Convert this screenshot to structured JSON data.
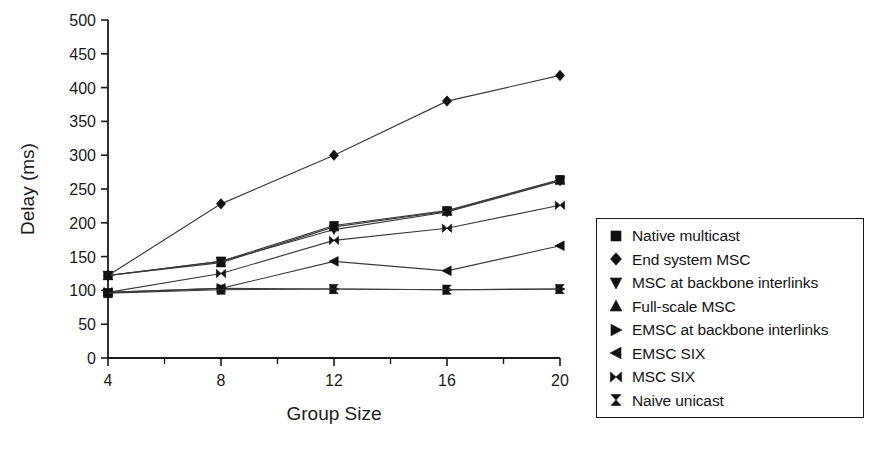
{
  "chart_data": {
    "type": "line",
    "title": "",
    "xlabel": "Group Size",
    "ylabel": "Delay (ms)",
    "x": [
      4,
      8,
      12,
      16,
      20
    ],
    "xticklabels": [
      "4",
      "8",
      "12",
      "16",
      "20"
    ],
    "yticklabels": [
      "0",
      "50",
      "100",
      "150",
      "200",
      "250",
      "300",
      "350",
      "400",
      "450",
      "500"
    ],
    "yticks": [
      0,
      50,
      100,
      150,
      200,
      250,
      300,
      350,
      400,
      450,
      500
    ],
    "xlim": [
      4,
      20
    ],
    "ylim": [
      0,
      500
    ],
    "grid": false,
    "legend_position": "right-outside",
    "minor_ticks_x": true,
    "series": [
      {
        "name": "Native multicast",
        "marker": "square",
        "values": [
          122,
          143,
          196,
          218,
          264
        ]
      },
      {
        "name": "End system MSC",
        "marker": "diamond",
        "values": [
          122,
          228,
          300,
          380,
          418
        ]
      },
      {
        "name": "MSC at backbone interlinks",
        "marker": "triangle-down",
        "values": [
          122,
          143,
          190,
          216,
          262
        ]
      },
      {
        "name": "Full-scale MSC",
        "marker": "triangle-up",
        "values": [
          122,
          141,
          194,
          217,
          263
        ]
      },
      {
        "name": "EMSC at backbone interlinks",
        "marker": "triangle-right",
        "values": [
          97,
          103,
          102,
          101,
          102
        ]
      },
      {
        "name": "EMSC SIX",
        "marker": "triangle-left",
        "values": [
          97,
          103,
          143,
          129,
          166
        ]
      },
      {
        "name": "MSC SIX",
        "marker": "bowtie",
        "values": [
          97,
          125,
          174,
          192,
          226
        ]
      },
      {
        "name": "Naive unicast",
        "marker": "hourglass",
        "values": [
          96,
          101,
          102,
          101,
          102
        ]
      }
    ]
  },
  "legend": {
    "items": [
      {
        "label": "Native multicast",
        "marker": "square"
      },
      {
        "label": "End system MSC",
        "marker": "diamond"
      },
      {
        "label": "MSC at backbone interlinks",
        "marker": "triangle-down"
      },
      {
        "label": "Full-scale MSC",
        "marker": "triangle-up"
      },
      {
        "label": "EMSC at backbone interlinks",
        "marker": "triangle-right"
      },
      {
        "label": "EMSC SIX",
        "marker": "triangle-left"
      },
      {
        "label": "MSC SIX",
        "marker": "bowtie"
      },
      {
        "label": "Naive unicast",
        "marker": "hourglass"
      }
    ]
  },
  "style": {
    "line_color": "#3a3a3a",
    "marker_color": "#111111",
    "axis_color": "#1a1a1a",
    "background": "#ffffff"
  }
}
